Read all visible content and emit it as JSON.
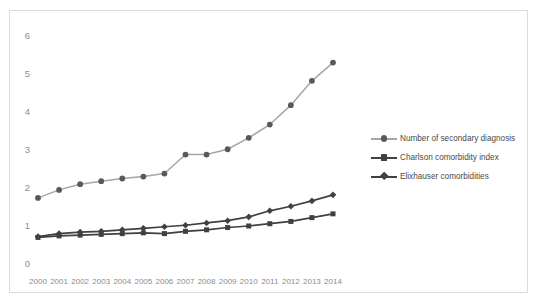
{
  "chart_data": {
    "type": "line",
    "title": "",
    "xlabel": "",
    "ylabel": "",
    "categories": [
      "2000",
      "2001",
      "2002",
      "2003",
      "2004",
      "2005",
      "2006",
      "2007",
      "2008",
      "2009",
      "2010",
      "2011",
      "2012",
      "2013",
      "2014"
    ],
    "x": [
      2000,
      2001,
      2002,
      2003,
      2004,
      2005,
      2006,
      2007,
      2008,
      2009,
      2010,
      2011,
      2012,
      2013,
      2014
    ],
    "ylim": [
      0,
      6
    ],
    "xlim": [
      2000,
      2014
    ],
    "yticks": [
      "0",
      "1",
      "2",
      "3",
      "4",
      "5",
      "6"
    ],
    "grid": false,
    "legend_position": "right",
    "series": [
      {
        "name": "Number of secondary diagnosis",
        "marker": "circle",
        "color": "#a6a6a6",
        "marker_color": "#595959",
        "values": [
          1.74,
          1.95,
          2.1,
          2.18,
          2.25,
          2.3,
          2.38,
          2.88,
          2.88,
          3.02,
          3.32,
          3.67,
          4.18,
          4.82,
          5.3
        ]
      },
      {
        "name": "Charlson comorbidity index",
        "marker": "square",
        "color": "#404040",
        "marker_color": "#404040",
        "values": [
          0.7,
          0.74,
          0.76,
          0.78,
          0.8,
          0.82,
          0.8,
          0.86,
          0.9,
          0.96,
          1.0,
          1.06,
          1.12,
          1.22,
          1.32
        ]
      },
      {
        "name": "Elixhauser comorbidities",
        "marker": "diamond",
        "color": "#404040",
        "marker_color": "#404040",
        "values": [
          0.72,
          0.8,
          0.84,
          0.86,
          0.9,
          0.94,
          0.98,
          1.02,
          1.08,
          1.14,
          1.24,
          1.4,
          1.52,
          1.66,
          1.82
        ]
      }
    ]
  },
  "legend": {
    "items": [
      {
        "label": "Number of secondary diagnosis"
      },
      {
        "label": "Charlson comorbidity index"
      },
      {
        "label": "Elixhauser comorbidities"
      }
    ]
  },
  "colors": {
    "series1": "#a6a6a6",
    "series2": "#404040",
    "series3": "#404040",
    "tick_text": "#8c8c8c",
    "legend_text": "#4a4a4a",
    "frame": "#dcdcdc"
  }
}
